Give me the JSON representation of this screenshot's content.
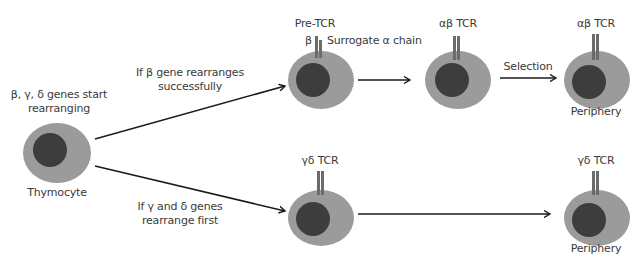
{
  "colors": {
    "cell_body": "#9b9b9b",
    "nucleus": "#3d3d3d",
    "receptor": "#6b6b6b",
    "arrow": "#1a1a1a",
    "text": "#3a3a3a"
  },
  "start": {
    "header_line1": "β, γ, δ genes start",
    "header_line2": "rearranging",
    "cell_label": "Thymocyte"
  },
  "branches": {
    "ab": {
      "condition_line1": "If β gene rearranges",
      "condition_line2": "successfully",
      "pre_tcr_label": "Pre-TCR",
      "beta_label": "β",
      "surrogate_label": "Surrogate α chain",
      "ab_tcr_label": "αβ TCR",
      "selection_label": "Selection",
      "final_tcr_label": "αβ TCR",
      "final_location": "Periphery"
    },
    "gd": {
      "condition_line1": "If γ and δ genes",
      "condition_line2": "rearrange first",
      "gd_tcr_label": "γδ TCR",
      "final_tcr_label": "γδ TCR",
      "final_location": "Periphery"
    }
  }
}
